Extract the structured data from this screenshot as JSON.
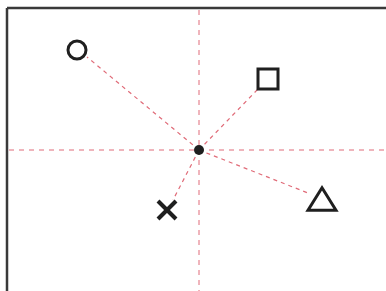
{
  "diagram": {
    "type": "radial-points-with-crosshair",
    "width": 386,
    "height": 291,
    "colors": {
      "background": "#ffffff",
      "frame": "#3a3a3a",
      "guide_lines": "#e06b78",
      "markers": "#1f1f1f"
    },
    "frame": {
      "left_x": 7,
      "top_y": 8,
      "stroke_width": 2.5
    },
    "crosshair": {
      "x": 199,
      "y": 150,
      "dash": "5,5"
    },
    "center_point": {
      "x": 199,
      "y": 150,
      "radius": 5,
      "shape": "filled-dot"
    },
    "points": [
      {
        "id": "circle",
        "shape": "circle",
        "x": 77,
        "y": 50,
        "size": 18,
        "edge_x": 87,
        "edge_y": 57
      },
      {
        "id": "square",
        "shape": "square",
        "x": 268,
        "y": 79,
        "size": 20,
        "edge_x": 258,
        "edge_y": 89
      },
      {
        "id": "triangle",
        "shape": "triangle",
        "x": 322,
        "y": 199,
        "size": 28,
        "edge_x": 308,
        "edge_y": 193
      },
      {
        "id": "cross",
        "shape": "x",
        "x": 167,
        "y": 210,
        "size": 18,
        "edge_x": 173,
        "edge_y": 200
      }
    ]
  }
}
